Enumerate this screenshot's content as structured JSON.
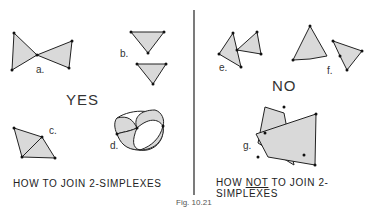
{
  "left_panel": {
    "heading": "YES",
    "caption": "HOW TO JOIN 2-SIMPLEXES",
    "labels": {
      "a": "a.",
      "b": "b.",
      "c": "c.",
      "d": "d."
    }
  },
  "right_panel": {
    "heading": "NO",
    "caption_prefix": "HOW ",
    "caption_emphasis": "NOT",
    "caption_suffix": " TO JOIN 2-SIMPLEXES",
    "labels": {
      "e": "e.",
      "f": "f.",
      "g": "g."
    }
  },
  "figure_caption": "Fig. 10.21",
  "colors": {
    "fill": "#d9d9d9",
    "stroke": "#222222"
  }
}
